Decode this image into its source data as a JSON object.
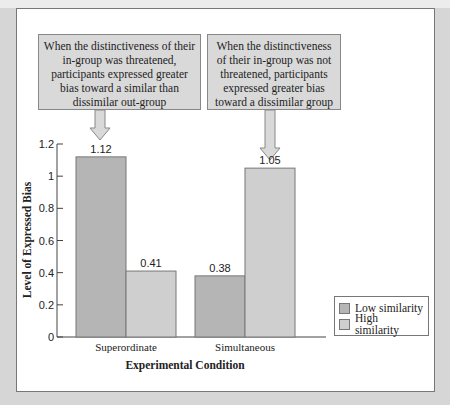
{
  "callouts": [
    {
      "text": "When the distinctiveness of their in-group was threatened, participants expressed greater bias toward a similar than dissimilar out-group"
    },
    {
      "text": "When the distinctiveness of their in-group was not threatened, participants expressed greater bias toward a dissimilar group"
    }
  ],
  "colors": {
    "low_similarity": "#b5b5b5",
    "high_similarity": "#cfcfcf",
    "callout_bg": "#d9d9d9",
    "page_bg": "#d6d6d6"
  },
  "chart_data": {
    "type": "bar",
    "title": "",
    "xlabel": "Experimental Condition",
    "ylabel": "Level of Expressed Bias",
    "categories": [
      "Superordinate",
      "Simultaneous"
    ],
    "series": [
      {
        "name": "Low similarity",
        "values": [
          1.12,
          0.38
        ]
      },
      {
        "name": "High similarity",
        "values": [
          0.41,
          1.05
        ]
      }
    ],
    "data_labels": [
      [
        "1.12",
        "0.41"
      ],
      [
        "0.38",
        "1.05"
      ]
    ],
    "yticks": [
      0,
      0.2,
      0.4,
      0.6,
      0.8,
      1,
      1.2
    ],
    "ytick_labels": [
      "0",
      "0.2",
      "0.4",
      "0.6",
      "0.8",
      "1",
      "1.2"
    ],
    "ylim": [
      0,
      1.2
    ],
    "grid": false,
    "legend_position": "right"
  }
}
